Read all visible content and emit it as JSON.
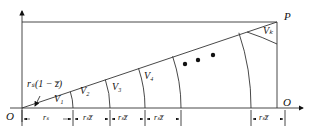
{
  "diagram": {
    "origin_label": "O",
    "x_axis_end_label": "O",
    "corner_label": "P",
    "inner_label": "rₛ(1 − z̅)",
    "regions": [
      "V₁",
      "V₂",
      "V₃",
      "V₄",
      "Vₖ"
    ],
    "ellipsis": "• • •",
    "dimensions": [
      "rₛ",
      "rₛz̅",
      "rₛz̅",
      "rₛz̅",
      "rₛz̅"
    ]
  }
}
